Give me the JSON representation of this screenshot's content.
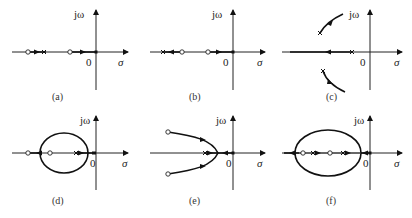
{
  "figure": {
    "axis_labels": {
      "imag": "jω",
      "real": "σ",
      "origin": "0"
    },
    "panels": [
      {
        "id": "a",
        "caption": "(a)",
        "description": "Real-axis root locus: segments between poles and zeros on negative real axis, arrows pointing left toward zeros"
      },
      {
        "id": "b",
        "caption": "(b)",
        "description": "Real-axis root locus: poles at left end moving right toward zero, pole at origin moving left toward zero"
      },
      {
        "id": "c",
        "caption": "(c)",
        "description": "Complex conjugate poles with branches departing to upper-right and lower-right; real-axis branch from pole moving left"
      },
      {
        "id": "d",
        "caption": "(d)",
        "description": "Root locus with circular branch breaking away and re-entering real axis between poles and zeros"
      },
      {
        "id": "e",
        "caption": "(e)",
        "description": "Parabolic-like branches breaking away from real axis and going to complex zeros on the left"
      },
      {
        "id": "f",
        "caption": "(f)",
        "description": "Large elliptical locus enclosing two zeros and two poles on the negative real axis"
      }
    ]
  }
}
